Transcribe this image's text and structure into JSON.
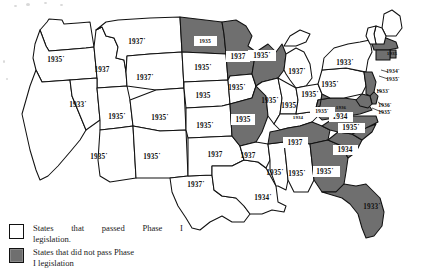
{
  "figure": {
    "type": "choropleth-map",
    "region": "United States"
  },
  "legend": {
    "items": [
      {
        "swatch": "white",
        "line1": "States that passed Phase I",
        "line2": "legislation."
      },
      {
        "swatch": "gray",
        "line1": "States that did not pass Phase",
        "line2": "I legislation"
      }
    ]
  },
  "map_data": {
    "type": "choropleth",
    "categories": [
      "passed",
      "not-passed"
    ],
    "colors": {
      "passed": "#ffffff",
      "not-passed": "#6f6f6f",
      "border": "#111111"
    },
    "states": [
      {
        "code": "WA",
        "label": "",
        "status": "passed",
        "x": 47,
        "y": 33
      },
      {
        "code": "OR",
        "label": "1935˙",
        "status": "passed",
        "x": 56,
        "y": 60
      },
      {
        "code": "CA",
        "label": "",
        "status": "passed",
        "x": 40,
        "y": 120
      },
      {
        "code": "ID",
        "label": "1937",
        "status": "passed",
        "x": 102,
        "y": 70
      },
      {
        "code": "NV",
        "label": "1933˙",
        "status": "passed",
        "x": 78,
        "y": 105
      },
      {
        "code": "UT",
        "label": "1935˙",
        "status": "passed",
        "x": 117,
        "y": 117
      },
      {
        "code": "MT",
        "label": "1937˙",
        "status": "passed",
        "x": 137,
        "y": 42
      },
      {
        "code": "WY",
        "label": "1937˙",
        "status": "passed",
        "x": 145,
        "y": 78
      },
      {
        "code": "CO",
        "label": "1935˙",
        "status": "passed",
        "x": 160,
        "y": 118
      },
      {
        "code": "AZ",
        "label": "1935˙",
        "status": "passed",
        "x": 99,
        "y": 157
      },
      {
        "code": "NM",
        "label": "1935˙",
        "status": "passed",
        "x": 152,
        "y": 157
      },
      {
        "code": "TX",
        "label": "1937˙",
        "status": "passed",
        "x": 196,
        "y": 185
      },
      {
        "code": "ND",
        "label": "1935",
        "status": "not-passed",
        "x": 205,
        "y": 42
      },
      {
        "code": "SD",
        "label": "1935˙",
        "status": "passed",
        "x": 203,
        "y": 68
      },
      {
        "code": "NE",
        "label": "1935",
        "status": "passed",
        "x": 203,
        "y": 96
      },
      {
        "code": "KS",
        "label": "1935˙",
        "status": "passed",
        "x": 205,
        "y": 126
      },
      {
        "code": "OK",
        "label": "1937",
        "status": "passed",
        "x": 215,
        "y": 155
      },
      {
        "code": "MN",
        "label": "1937",
        "status": "not-passed",
        "x": 238,
        "y": 57
      },
      {
        "code": "IA",
        "label": "1935˙",
        "status": "passed",
        "x": 237,
        "y": 88
      },
      {
        "code": "MO",
        "label": "1935",
        "status": "not-passed",
        "x": 243,
        "y": 120
      },
      {
        "code": "AR",
        "label": "1937",
        "status": "passed",
        "x": 248,
        "y": 156
      },
      {
        "code": "LA",
        "label": "1934˙",
        "status": "passed",
        "x": 263,
        "y": 198
      },
      {
        "code": "WI",
        "label": "1935˙",
        "status": "not-passed",
        "x": 262,
        "y": 56
      },
      {
        "code": "IL",
        "label": "1935˙",
        "status": "passed",
        "x": 270,
        "y": 101
      },
      {
        "code": "MS",
        "label": "1935˙",
        "status": "passed",
        "x": 275,
        "y": 173
      },
      {
        "code": "MI",
        "label": "1937˙",
        "status": "passed",
        "x": 297,
        "y": 72
      },
      {
        "code": "IN",
        "label": "1935˙",
        "status": "passed",
        "x": 290,
        "y": 106
      },
      {
        "code": "KY",
        "label": "1934",
        "status": "passed",
        "x": 298,
        "y": 118
      },
      {
        "code": "TN",
        "label": "1937",
        "status": "not-passed",
        "x": 295,
        "y": 143
      },
      {
        "code": "AL",
        "label": "1935˙",
        "status": "passed",
        "x": 297,
        "y": 174
      },
      {
        "code": "OH",
        "label": "1935˙",
        "status": "passed",
        "x": 310,
        "y": 95
      },
      {
        "code": "GA",
        "label": "1935˙",
        "status": "not-passed",
        "x": 325,
        "y": 172
      },
      {
        "code": "FL",
        "label": "1933˙",
        "status": "not-passed",
        "x": 372,
        "y": 207
      },
      {
        "code": "SC",
        "label": "1934",
        "status": "not-passed",
        "x": 345,
        "y": 150
      },
      {
        "code": "NC",
        "label": "1935˙",
        "status": "not-passed",
        "x": 351,
        "y": 128
      },
      {
        "code": "VA",
        "label": "1934",
        "status": "not-passed",
        "x": 340,
        "y": 117
      },
      {
        "code": "WV",
        "label": "1935˙",
        "status": "not-passed",
        "x": 322,
        "y": 112
      },
      {
        "code": "VA2",
        "label": "1936",
        "status": "not-passed",
        "x": 341,
        "y": 108
      },
      {
        "code": "PA",
        "label": "1935˙",
        "status": "passed",
        "x": 330,
        "y": 85
      },
      {
        "code": "NY",
        "label": "1933˙",
        "status": "passed",
        "x": 345,
        "y": 63
      },
      {
        "code": "NJ",
        "label": "1933˙",
        "status": "not-passed",
        "x": 383,
        "y": 92
      },
      {
        "code": "DE",
        "label": "1936˙",
        "status": "not-passed",
        "x": 385,
        "y": 106
      },
      {
        "code": "MD",
        "label": "1935˙",
        "status": "not-passed",
        "x": 385,
        "y": 113
      },
      {
        "code": "MA",
        "label": "1935",
        "status": "not-passed",
        "x": 392,
        "y": 54
      },
      {
        "code": "RI",
        "label": "1934˙",
        "status": "not-passed",
        "x": 393,
        "y": 72
      },
      {
        "code": "CT",
        "label": "1935˙",
        "status": "not-passed",
        "x": 393,
        "y": 80
      },
      {
        "code": "ME",
        "label": "",
        "status": "passed",
        "x": 395,
        "y": 25
      },
      {
        "code": "NH",
        "label": "",
        "status": "passed",
        "x": 378,
        "y": 38
      },
      {
        "code": "VT",
        "label": "",
        "status": "passed",
        "x": 369,
        "y": 38
      }
    ]
  }
}
